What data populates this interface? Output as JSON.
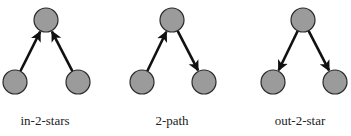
{
  "colors": {
    "node_fill": "#9b9b9b",
    "node_stroke": "#2a2a2a",
    "edge": "#111111",
    "background": "#ffffff"
  },
  "node_radius": 12,
  "motifs": [
    {
      "label": "in-2-stars",
      "label_x": 45,
      "nodes": [
        {
          "id": "top",
          "x": 46,
          "y": 20
        },
        {
          "id": "left",
          "x": 15,
          "y": 82
        },
        {
          "id": "right",
          "x": 78,
          "y": 82
        }
      ],
      "edges": [
        {
          "from": "left",
          "to": "top"
        },
        {
          "from": "right",
          "to": "top"
        }
      ]
    },
    {
      "label": "2-path",
      "label_x": 172,
      "nodes": [
        {
          "id": "top",
          "x": 172,
          "y": 20
        },
        {
          "id": "left",
          "x": 142,
          "y": 82
        },
        {
          "id": "right",
          "x": 204,
          "y": 82
        }
      ],
      "edges": [
        {
          "from": "left",
          "to": "top"
        },
        {
          "from": "top",
          "to": "right"
        }
      ]
    },
    {
      "label": "out-2-star",
      "label_x": 300,
      "nodes": [
        {
          "id": "top",
          "x": 303,
          "y": 20
        },
        {
          "id": "left",
          "x": 273,
          "y": 82
        },
        {
          "id": "right",
          "x": 335,
          "y": 82
        }
      ],
      "edges": [
        {
          "from": "top",
          "to": "left"
        },
        {
          "from": "top",
          "to": "right"
        }
      ]
    }
  ]
}
